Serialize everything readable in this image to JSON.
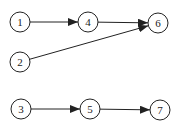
{
  "diagram": {
    "type": "directed-graph",
    "nodes": [
      {
        "id": "1",
        "label": "1",
        "x": 20,
        "y": 22
      },
      {
        "id": "4",
        "label": "4",
        "x": 88,
        "y": 22
      },
      {
        "id": "6",
        "label": "6",
        "x": 158,
        "y": 23
      },
      {
        "id": "2",
        "label": "2",
        "x": 20,
        "y": 62
      },
      {
        "id": "3",
        "label": "3",
        "x": 21,
        "y": 109
      },
      {
        "id": "5",
        "label": "5",
        "x": 90,
        "y": 109
      },
      {
        "id": "7",
        "label": "7",
        "x": 160,
        "y": 110
      }
    ],
    "edges": [
      {
        "from": "1",
        "to": "4"
      },
      {
        "from": "4",
        "to": "6"
      },
      {
        "from": "2",
        "to": "6"
      },
      {
        "from": "3",
        "to": "5"
      },
      {
        "from": "5",
        "to": "7"
      }
    ],
    "colors": {
      "stroke": "#222222",
      "fill": "#ffffff"
    }
  }
}
